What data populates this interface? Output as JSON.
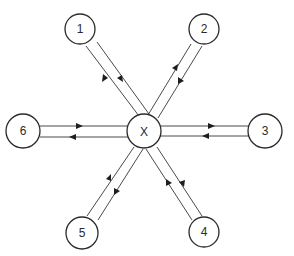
{
  "diagram": {
    "type": "hub-and-spoke network",
    "hub": {
      "id": "X",
      "label": "X",
      "cx": 144,
      "cy": 131,
      "r": 17
    },
    "nodes": [
      {
        "id": "1",
        "label": "1",
        "cx": 80,
        "cy": 29,
        "r": 15
      },
      {
        "id": "2",
        "label": "2",
        "cx": 204,
        "cy": 29,
        "r": 15
      },
      {
        "id": "3",
        "label": "3",
        "cx": 265,
        "cy": 131,
        "r": 17
      },
      {
        "id": "4",
        "label": "4",
        "cx": 204,
        "cy": 232,
        "r": 15
      },
      {
        "id": "5",
        "label": "5",
        "cx": 82,
        "cy": 233,
        "r": 16
      },
      {
        "id": "6",
        "label": "6",
        "cx": 23,
        "cy": 131,
        "r": 17
      }
    ],
    "edges": [
      {
        "from": "1",
        "to": "X",
        "direction": "bidirectional",
        "arrows": [
          "1→X",
          "X→1"
        ]
      },
      {
        "from": "2",
        "to": "X",
        "direction": "bidirectional",
        "arrows": [
          "2→X",
          "X→2"
        ]
      },
      {
        "from": "3",
        "to": "X",
        "direction": "bidirectional",
        "arrows": [
          "X→3",
          "3→X"
        ]
      },
      {
        "from": "4",
        "to": "X",
        "direction": "bidirectional",
        "arrows": [
          "X→4",
          "4→X"
        ]
      },
      {
        "from": "5",
        "to": "X",
        "direction": "bidirectional",
        "arrows": [
          "5→X",
          "X→5"
        ]
      },
      {
        "from": "6",
        "to": "X",
        "direction": "bidirectional",
        "arrows": [
          "6→X",
          "X→6"
        ]
      }
    ],
    "colors": {
      "stroke": "#2a2a2a",
      "line": "#4a4a4a",
      "background": "#ffffff"
    }
  }
}
